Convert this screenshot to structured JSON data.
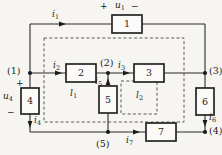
{
  "figure": {
    "colors": {
      "background": "#f6f5f2",
      "wire": "#2b2b2b",
      "dashed_loop": "#4a4a4a",
      "box_fill": "#fbfaf8"
    },
    "nodes": {
      "n1": "(1)",
      "n2": "(2)",
      "n3": "(3)",
      "n4": "(4)",
      "n5": "(5)"
    },
    "elements": {
      "e1": "1",
      "e2": "2",
      "e3": "3",
      "e4": "4",
      "e5": "5",
      "e6": "6",
      "e7": "7"
    },
    "currents": {
      "i1": {
        "base": "i",
        "sub": "1"
      },
      "i2": {
        "base": "i",
        "sub": "2"
      },
      "i3": {
        "base": "i",
        "sub": "3"
      },
      "i4": {
        "base": "i",
        "sub": "4"
      },
      "i5": {
        "base": "i",
        "sub": "5"
      },
      "i6": {
        "base": "i",
        "sub": "6"
      },
      "i7": {
        "base": "i",
        "sub": "7"
      }
    },
    "voltages": {
      "u1": {
        "plus": "+",
        "base": "u",
        "sub": "1",
        "minus": "−"
      },
      "u4": {
        "plus": "+",
        "base": "u",
        "sub": "4",
        "minus": "−"
      }
    },
    "loops": {
      "l1": {
        "base": "l",
        "sub": "1"
      },
      "l2": {
        "base": "l",
        "sub": "2"
      }
    }
  }
}
